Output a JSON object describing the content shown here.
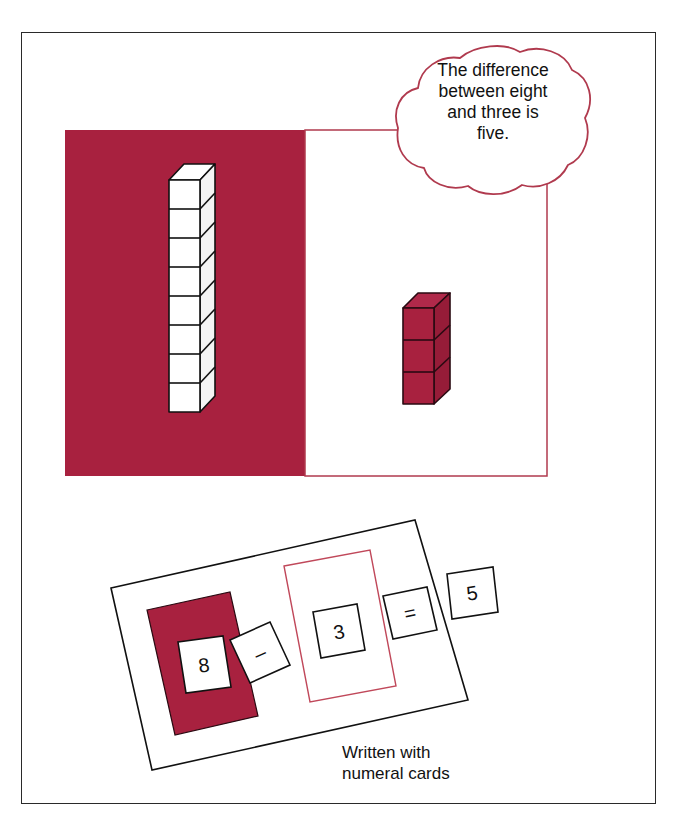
{
  "figure": {
    "thought_bubble": {
      "lines": [
        "The difference",
        "between eight",
        "and three is",
        "five."
      ]
    },
    "caption": {
      "lines": [
        "Written with",
        "numeral cards"
      ]
    },
    "mats": {
      "left_mat": {
        "color": "#a8213f",
        "label": "eight"
      },
      "right_mat": {
        "color": "#ffffff",
        "border": "#b03a4e",
        "label": "three"
      }
    },
    "blocks": {
      "tall_stack": {
        "count": 8,
        "fill": "#ffffff"
      },
      "short_stack": {
        "count": 3,
        "fill": "#a8213f"
      }
    },
    "cards": {
      "minuend": "8",
      "operator_minus": "–",
      "subtrahend": "3",
      "operator_equals": "=",
      "difference": "5"
    },
    "colors": {
      "accent_red": "#a8213f",
      "outline_red": "#b03a4e",
      "stroke": "#1a1a1a"
    }
  }
}
